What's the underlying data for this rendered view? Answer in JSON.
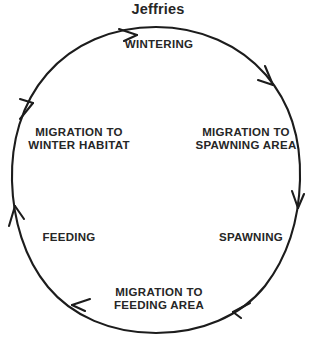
{
  "figure": {
    "title": "Jeffries",
    "type": "cycle-diagram",
    "direction": "clockwise",
    "stroke_color": "#1c1c1c",
    "text_color": "#262626",
    "background_color": "#ffffff",
    "stages": [
      {
        "id": "wintering",
        "label": "WINTERING"
      },
      {
        "id": "migration-to-spawning-area",
        "label": "MIGRATION TO\nSPAWNING AREA"
      },
      {
        "id": "spawning",
        "label": "SPAWNING"
      },
      {
        "id": "migration-to-feeding-area",
        "label": "MIGRATION TO\nFEEDING AREA"
      },
      {
        "id": "feeding",
        "label": "FEEDING"
      },
      {
        "id": "migration-to-winter-habitat",
        "label": "MIGRATION TO\nWINTER HABITAT"
      }
    ],
    "arrowheads": [
      {
        "id": "arrow-top",
        "position_deg": 350,
        "points": "clockwise"
      },
      {
        "id": "arrow-upper-right",
        "position_deg": 40,
        "points": "clockwise"
      },
      {
        "id": "arrow-right",
        "position_deg": 85,
        "points": "clockwise"
      },
      {
        "id": "arrow-lower-right",
        "position_deg": 130,
        "points": "clockwise"
      },
      {
        "id": "arrow-lower-left",
        "position_deg": 215,
        "points": "clockwise"
      },
      {
        "id": "arrow-left",
        "position_deg": 260,
        "points": "clockwise"
      },
      {
        "id": "arrow-upper-left",
        "position_deg": 305,
        "points": "clockwise"
      }
    ]
  }
}
